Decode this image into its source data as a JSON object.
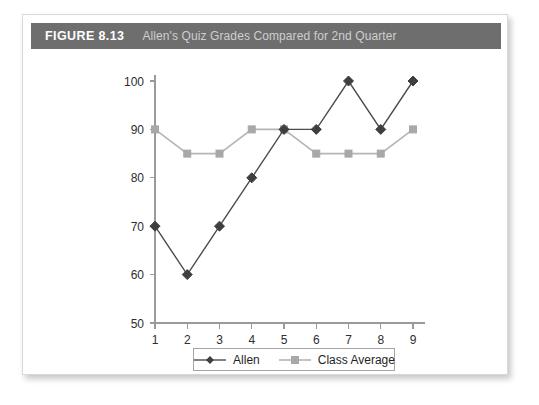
{
  "figure": {
    "number_label": "FIGURE 8.13",
    "title": "Allen's Quiz Grades Compared for 2nd Quarter"
  },
  "colors": {
    "header_bar": "#6e6e6e",
    "header_number_text": "#ffffff",
    "header_title_text": "#cfcfcf",
    "allen_series": "#4c4c4c",
    "class_average_series": "#b5b5b5",
    "axis": "#9a9a9a",
    "card_background": "#ffffff"
  },
  "chart_data": {
    "type": "line",
    "title": "Allen's Quiz Grades Compared for 2nd Quarter",
    "xlabel": "",
    "ylabel": "",
    "x": [
      1,
      2,
      3,
      4,
      5,
      6,
      7,
      8,
      9
    ],
    "categories": [
      "1",
      "2",
      "3",
      "4",
      "5",
      "6",
      "7",
      "8",
      "9"
    ],
    "xlim": [
      1,
      9
    ],
    "ylim": [
      50,
      100
    ],
    "yticks": [
      50,
      60,
      70,
      80,
      90,
      100
    ],
    "ytick_labels": [
      "50",
      "60",
      "70",
      "80",
      "90",
      "100"
    ],
    "xticks": [
      1,
      2,
      3,
      4,
      5,
      6,
      7,
      8,
      9
    ],
    "xtick_labels": [
      "1",
      "2",
      "3",
      "4",
      "5",
      "6",
      "7",
      "8",
      "9"
    ],
    "grid": false,
    "legend_position": "bottom-center",
    "series": [
      {
        "name": "Allen",
        "marker": "diamond",
        "color": "#4c4c4c",
        "values": [
          70,
          60,
          70,
          80,
          90,
          90,
          100,
          90,
          100
        ]
      },
      {
        "name": "Class Average",
        "marker": "square",
        "color": "#b5b5b5",
        "values": [
          90,
          85,
          85,
          90,
          90,
          85,
          85,
          85,
          90
        ]
      }
    ]
  },
  "legend": {
    "entries": [
      {
        "label": "Allen"
      },
      {
        "label": "Class Average"
      }
    ]
  }
}
